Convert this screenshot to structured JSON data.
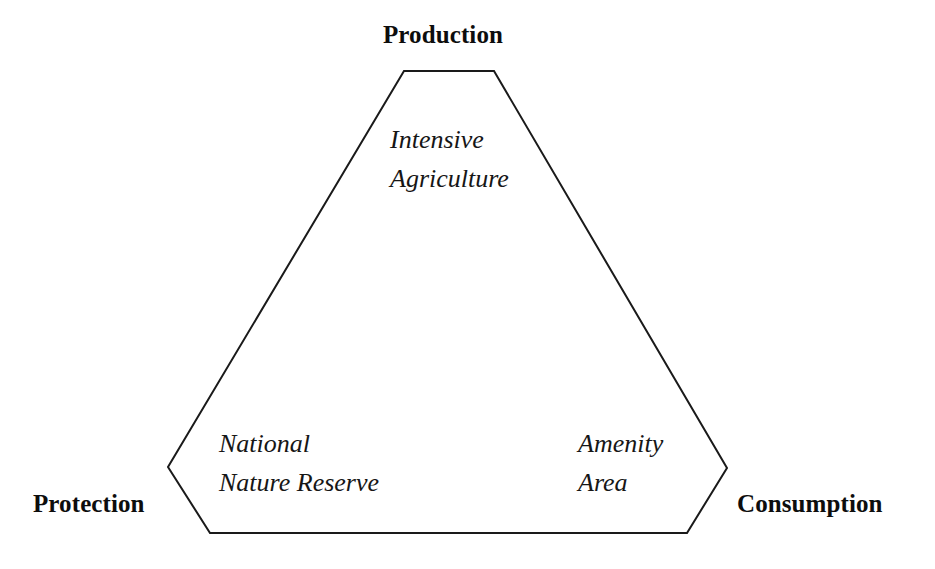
{
  "diagram": {
    "type": "truncated-triangle-ternary-diagram",
    "background_color": "#ffffff",
    "outline_color": "#1a1a1a",
    "outline_width_px": 2,
    "shape_points": "404,71 494,71 727,468 687,533 210,533 168,467",
    "corner_labels": [
      {
        "id": "production",
        "text": "Production",
        "position": "top"
      },
      {
        "id": "protection",
        "text": "Protection",
        "position": "bottom-left"
      },
      {
        "id": "consumption",
        "text": "Consumption",
        "position": "bottom-right"
      }
    ],
    "zone_labels": [
      {
        "id": "intensive-agriculture",
        "text": "Intensive\nAgriculture",
        "position": "top-center"
      },
      {
        "id": "national-nature-reserve",
        "text": "National\nNature Reserve",
        "position": "bottom-left"
      },
      {
        "id": "amenity-area",
        "text": "Amenity\nArea",
        "position": "bottom-right"
      }
    ]
  }
}
